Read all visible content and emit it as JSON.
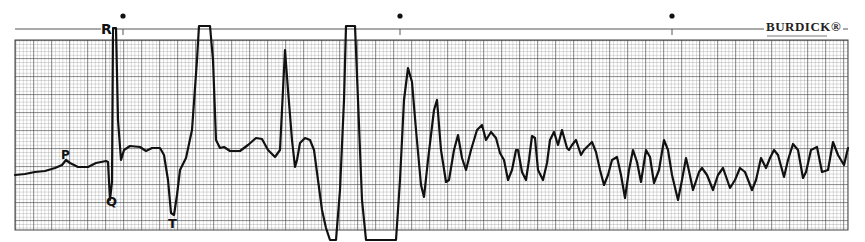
{
  "strip": {
    "brand": "BURDICK®",
    "paper_color": "#ffffff",
    "grid_color": "#555555",
    "trace_color": "#111111"
  },
  "labels": {
    "p": "P",
    "q": "Q",
    "r": "R",
    "t": "T"
  },
  "chart_data": {
    "type": "line",
    "xlabel": "",
    "ylabel": "",
    "grid": true,
    "grid_spec": {
      "major_px": 18,
      "minor_px": 3.6,
      "x_range_px": [
        15,
        848
      ],
      "y_range_px": [
        40,
        230
      ]
    },
    "timing_marks_x_px": [
      123,
      400,
      672
    ],
    "annotations": [
      {
        "text": "P",
        "x": 66,
        "y": 155
      },
      {
        "text": "Q",
        "x": 112,
        "y": 200
      },
      {
        "text": "R",
        "x": 108,
        "y": 30
      },
      {
        "text": "T",
        "x": 173,
        "y": 222
      }
    ],
    "series": [
      {
        "name": "ECG trace",
        "points_px": [
          [
            15,
            175
          ],
          [
            25,
            174
          ],
          [
            35,
            172
          ],
          [
            45,
            171
          ],
          [
            55,
            168
          ],
          [
            62,
            165
          ],
          [
            66,
            160
          ],
          [
            70,
            163
          ],
          [
            78,
            167
          ],
          [
            88,
            167
          ],
          [
            96,
            163
          ],
          [
            106,
            161
          ],
          [
            108,
            162
          ],
          [
            110,
            200
          ],
          [
            112,
            182
          ],
          [
            113,
            28
          ],
          [
            116,
            28
          ],
          [
            118,
            120
          ],
          [
            121,
            160
          ],
          [
            124,
            150
          ],
          [
            130,
            146
          ],
          [
            140,
            147
          ],
          [
            146,
            151
          ],
          [
            152,
            148
          ],
          [
            160,
            148
          ],
          [
            164,
            155
          ],
          [
            168,
            180
          ],
          [
            171,
            213
          ],
          [
            174,
            215
          ],
          [
            177,
            195
          ],
          [
            180,
            170
          ],
          [
            186,
            158
          ],
          [
            192,
            130
          ],
          [
            197,
            60
          ],
          [
            199,
            26
          ],
          [
            210,
            26
          ],
          [
            213,
            60
          ],
          [
            216,
            140
          ],
          [
            220,
            148
          ],
          [
            224,
            147
          ],
          [
            230,
            151
          ],
          [
            240,
            151
          ],
          [
            248,
            145
          ],
          [
            256,
            138
          ],
          [
            262,
            139
          ],
          [
            268,
            150
          ],
          [
            275,
            157
          ],
          [
            280,
            150
          ],
          [
            283,
            90
          ],
          [
            285,
            50
          ],
          [
            288,
            90
          ],
          [
            292,
            140
          ],
          [
            295,
            167
          ],
          [
            297,
            160
          ],
          [
            300,
            143
          ],
          [
            305,
            138
          ],
          [
            310,
            140
          ],
          [
            314,
            150
          ],
          [
            318,
            180
          ],
          [
            322,
            210
          ],
          [
            326,
            228
          ],
          [
            330,
            240
          ],
          [
            336,
            240
          ],
          [
            340,
            190
          ],
          [
            344,
            100
          ],
          [
            346,
            26
          ],
          [
            355,
            26
          ],
          [
            358,
            100
          ],
          [
            362,
            200
          ],
          [
            366,
            240
          ],
          [
            396,
            240
          ],
          [
            400,
            180
          ],
          [
            404,
            100
          ],
          [
            408,
            68
          ],
          [
            412,
            82
          ],
          [
            416,
            130
          ],
          [
            421,
            185
          ],
          [
            424,
            197
          ],
          [
            428,
            160
          ],
          [
            434,
            110
          ],
          [
            437,
            100
          ],
          [
            441,
            150
          ],
          [
            446,
            182
          ],
          [
            449,
            180
          ],
          [
            454,
            150
          ],
          [
            458,
            135
          ],
          [
            462,
            158
          ],
          [
            466,
            170
          ],
          [
            471,
            150
          ],
          [
            477,
            130
          ],
          [
            482,
            125
          ],
          [
            486,
            140
          ],
          [
            491,
            132
          ],
          [
            496,
            138
          ],
          [
            500,
            153
          ],
          [
            504,
            160
          ],
          [
            508,
            180
          ],
          [
            512,
            170
          ],
          [
            516,
            150
          ],
          [
            518,
            150
          ],
          [
            522,
            172
          ],
          [
            526,
            180
          ],
          [
            529,
            160
          ],
          [
            532,
            136
          ],
          [
            535,
            138
          ],
          [
            538,
            170
          ],
          [
            543,
            180
          ],
          [
            547,
            163
          ],
          [
            550,
            140
          ],
          [
            554,
            132
          ],
          [
            558,
            145
          ],
          [
            562,
            130
          ],
          [
            567,
            148
          ],
          [
            569,
            150
          ],
          [
            572,
            145
          ],
          [
            576,
            140
          ],
          [
            581,
            155
          ],
          [
            584,
            150
          ],
          [
            589,
            145
          ],
          [
            592,
            142
          ],
          [
            596,
            152
          ],
          [
            600,
            170
          ],
          [
            604,
            185
          ],
          [
            608,
            175
          ],
          [
            612,
            160
          ],
          [
            617,
            157
          ],
          [
            621,
            175
          ],
          [
            625,
            198
          ],
          [
            629,
            170
          ],
          [
            633,
            150
          ],
          [
            637,
            162
          ],
          [
            641,
            182
          ],
          [
            646,
            150
          ],
          [
            650,
            157
          ],
          [
            654,
            183
          ],
          [
            659,
            170
          ],
          [
            664,
            140
          ],
          [
            668,
            150
          ],
          [
            672,
            175
          ],
          [
            678,
            200
          ],
          [
            682,
            180
          ],
          [
            686,
            158
          ],
          [
            689,
            171
          ],
          [
            693,
            190
          ],
          [
            699,
            172
          ],
          [
            702,
            168
          ],
          [
            707,
            175
          ],
          [
            713,
            190
          ],
          [
            718,
            175
          ],
          [
            723,
            168
          ],
          [
            730,
            188
          ],
          [
            735,
            180
          ],
          [
            740,
            168
          ],
          [
            745,
            172
          ],
          [
            752,
            190
          ],
          [
            756,
            180
          ],
          [
            761,
            158
          ],
          [
            766,
            168
          ],
          [
            770,
            158
          ],
          [
            774,
            150
          ],
          [
            778,
            155
          ],
          [
            784,
            177
          ],
          [
            788,
            160
          ],
          [
            793,
            144
          ],
          [
            798,
            150
          ],
          [
            803,
            178
          ],
          [
            806,
            172
          ],
          [
            811,
            150
          ],
          [
            817,
            147
          ],
          [
            822,
            172
          ],
          [
            828,
            170
          ],
          [
            833,
            142
          ],
          [
            838,
            155
          ],
          [
            844,
            165
          ],
          [
            848,
            148
          ]
        ]
      }
    ]
  }
}
